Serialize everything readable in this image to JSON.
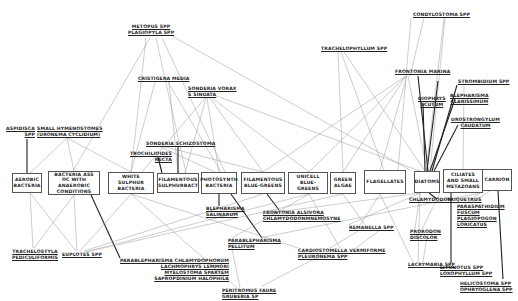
{
  "diagram": {
    "type": "food-web",
    "basal_nodes": [
      {
        "id": "aerobic",
        "label": "AEROBIC BACTERIA",
        "x": 12,
        "y": 173,
        "w": 30,
        "h": 20
      },
      {
        "id": "anaerobic",
        "label": "BACTERIA ASS OC WITH ANAEROBIC CONDITIONS",
        "x": 48,
        "y": 171,
        "w": 52,
        "h": 24
      },
      {
        "id": "white_sulphur",
        "label": "WHITE SULPHUR BACTERIA",
        "x": 108,
        "y": 172,
        "w": 46,
        "h": 22
      },
      {
        "id": "filamentous_sulphur",
        "label": "FILAMENTOUS SULPHURBACT",
        "x": 157,
        "y": 173,
        "w": 42,
        "h": 20
      },
      {
        "id": "photosynth",
        "label": "PHOTOSYNTH BACTERIA",
        "x": 201,
        "y": 172,
        "w": 36,
        "h": 22
      },
      {
        "id": "filamentous_bg",
        "label": "FILAMENTOUS BLUE-GREENS",
        "x": 241,
        "y": 172,
        "w": 44,
        "h": 22
      },
      {
        "id": "unicell_bg",
        "label": "UNICELL BLUE-GREENS",
        "x": 288,
        "y": 172,
        "w": 40,
        "h": 22
      },
      {
        "id": "green_algae",
        "label": "GREEN ALGAE",
        "x": 330,
        "y": 172,
        "w": 26,
        "h": 22
      },
      {
        "id": "flagellates",
        "label": "FLAGELLATES",
        "x": 364,
        "y": 170,
        "w": 42,
        "h": 24
      },
      {
        "id": "diatoms",
        "label": "DIATOMS",
        "x": 414,
        "y": 171,
        "w": 26,
        "h": 22
      },
      {
        "id": "ciliates",
        "label": "CILIATES AND SMALL METAZOANS",
        "x": 443,
        "y": 169,
        "w": 40,
        "h": 24
      },
      {
        "id": "carrion",
        "label": "CARRION",
        "x": 482,
        "y": 169,
        "w": 30,
        "h": 22
      }
    ],
    "taxa": [
      {
        "id": "metopus",
        "lines": [
          "METOPUS SPP",
          "PLAGIOPYLA SPP"
        ],
        "x": 128,
        "y": 24,
        "align": "center"
      },
      {
        "id": "cristigera",
        "lines": [
          "CRISTIGERA MEDIA"
        ],
        "x": 138,
        "y": 76
      },
      {
        "id": "aspidisca",
        "lines": [
          "ASPIDISCA",
          "SPP"
        ],
        "x": 6,
        "y": 126,
        "align": "right"
      },
      {
        "id": "small_hymenostomes",
        "lines": [
          "SMALL HYMENOSTOMES",
          "(URONEMA CYCLIDIUM)"
        ],
        "x": 37,
        "y": 126
      },
      {
        "id": "sonderia_vorax",
        "lines": [
          "SONDERIA VORAX",
          "S SINUATA"
        ],
        "x": 188,
        "y": 86
      },
      {
        "id": "sonderia_schizo",
        "lines": [
          "SONDERIA SCHIZOSTOMA"
        ],
        "x": 146,
        "y": 141
      },
      {
        "id": "trochilioides",
        "lines": [
          "TROCHILIOIDES",
          "RECTA"
        ],
        "x": 130,
        "y": 151,
        "align": "right"
      },
      {
        "id": "trachelophyllum",
        "lines": [
          "TRACHELOPHYLLUM SPP"
        ],
        "x": 321,
        "y": 46
      },
      {
        "id": "condylostoma",
        "lines": [
          "CONDYLOSTOMA SPP"
        ],
        "x": 413,
        "y": 12
      },
      {
        "id": "frontonia_marina",
        "lines": [
          "FRONTONIA MARINA"
        ],
        "x": 395,
        "y": 69
      },
      {
        "id": "strombidium",
        "lines": [
          "STROMBIDIUM SPP"
        ],
        "x": 458,
        "y": 79
      },
      {
        "id": "dysteria",
        "lines": [
          "DIOPHRYS",
          "SCUTUM"
        ],
        "x": 418,
        "y": 96,
        "align": "center"
      },
      {
        "id": "blepharisma",
        "lines": [
          "BLEPHARISMA",
          "CLARISSIMUM"
        ],
        "x": 450,
        "y": 93,
        "align": "center"
      },
      {
        "id": "urostrongylum",
        "lines": [
          "UROSTRONGYLUM",
          "CAUDATUM"
        ],
        "x": 451,
        "y": 117,
        "align": "center"
      },
      {
        "id": "blepharisma_salinarum",
        "lines": [
          "BLEPHARISMA",
          "SALINARUM"
        ],
        "x": 206,
        "y": 206
      },
      {
        "id": "frontonia_alsivora",
        "lines": [
          "FRONTONIA ALSIVORA",
          "CHLAMYDODONMNEMOSYNE"
        ],
        "x": 263,
        "y": 210
      },
      {
        "id": "chlamydodon",
        "lines": [
          "CHLAMYDODON"
        ],
        "x": 409,
        "y": 197
      },
      {
        "id": "trichopelma",
        "lines": [
          "TRIQUETRUS"
        ],
        "x": 447,
        "y": 197
      },
      {
        "id": "remanella",
        "lines": [
          "REMANELLA SPP"
        ],
        "x": 349,
        "y": 225
      },
      {
        "id": "parablepharisma_pellitum",
        "lines": [
          "PARABLEPHARISMA",
          "PELLITUM"
        ],
        "x": 228,
        "y": 238
      },
      {
        "id": "cardiostomella",
        "lines": [
          "CARDIOSTOMELLA VERMIFORME",
          "PLEURONEMA SPP"
        ],
        "x": 298,
        "y": 248
      },
      {
        "id": "parablepharisma_chlamy",
        "lines": [
          "PARABLEPHARISMA CHLAMYDOPHORUM",
          "LACHMOPHRYS LEMMORI",
          "MYELOSTOMA SPARTEM",
          "SAPROPDINIUM HALOPHILA"
        ],
        "x": 120,
        "y": 258,
        "align": "right"
      },
      {
        "id": "peritromus",
        "lines": [
          "PERITROMUS FAURE",
          "GRUBERIA SP"
        ],
        "x": 222,
        "y": 288
      },
      {
        "id": "tracheloetylla",
        "lines": [
          "TRACHELOSTYLA",
          "PEDICULIFORMIS"
        ],
        "x": 12,
        "y": 249,
        "align": "center"
      },
      {
        "id": "euplotes",
        "lines": [
          "EUPLOTES SPP"
        ],
        "x": 62,
        "y": 252
      },
      {
        "id": "parapathodium",
        "lines": [
          "PARASPATHIDIUM",
          "FUSCUM",
          "PLAGIOPOGON",
          "LORICATUS"
        ],
        "x": 457,
        "y": 204
      },
      {
        "id": "prorodon",
        "lines": [
          "PRORODON",
          "DISCOLOR"
        ],
        "x": 410,
        "y": 229
      },
      {
        "id": "litonotus",
        "lines": [
          "LITONOTUS SPP",
          "LOXOPHYLLUM SPP"
        ],
        "x": 440,
        "y": 265
      },
      {
        "id": "lacrymaria",
        "lines": [
          "LACRYMARIA SPP"
        ],
        "x": 408,
        "y": 262
      },
      {
        "id": "helicostoma",
        "lines": [
          "HELICOSTOMA SPP",
          "OPHRYOGLENA SPP"
        ],
        "x": 460,
        "y": 281
      }
    ]
  }
}
